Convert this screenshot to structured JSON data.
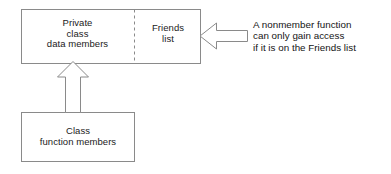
{
  "diagram": {
    "stroke_color": "#8a8a8a",
    "text_color": "#1a1a1a",
    "background_color": "#ffffff",
    "boxes": [
      {
        "id": "private-data-box",
        "label": "Private\nclass\ndata members",
        "lines": [
          "Private",
          "class",
          "data members"
        ]
      },
      {
        "id": "friends-list-box",
        "label": "Friends\nlist",
        "lines": [
          "Friends",
          "list"
        ]
      },
      {
        "id": "class-function-members-box",
        "label": "Class\nfunction members",
        "lines": [
          "Class",
          "function members"
        ]
      }
    ],
    "annotation": {
      "id": "nonmember-annotation",
      "text": "A nonmember function\ncan only gain access\nif it is on the Friends list",
      "lines": [
        "A nonmember function",
        "can only gain access",
        "if it is on the Friends list"
      ]
    },
    "arrows": [
      {
        "id": "annotation-arrow",
        "direction": "left",
        "meaning": "points from annotation to Friends list box"
      },
      {
        "id": "member-access-arrow",
        "direction": "up",
        "meaning": "points from class function members to private class data members"
      }
    ],
    "divider": {
      "id": "private-friends-divider",
      "style": "dashed",
      "orientation": "vertical"
    }
  }
}
